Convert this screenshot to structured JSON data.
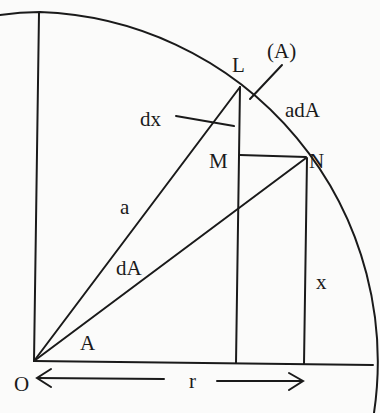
{
  "diagram": {
    "labels": {
      "O": "O",
      "L": "L",
      "M": "M",
      "N": "N",
      "A_paren": "(A)",
      "adA": "adA",
      "dx": "dx",
      "a": "a",
      "dA": "dA",
      "A": "A",
      "x": "x",
      "r": "r"
    },
    "colors": {
      "stroke": "#1a1a1a",
      "background": "#fbfbfa"
    }
  }
}
